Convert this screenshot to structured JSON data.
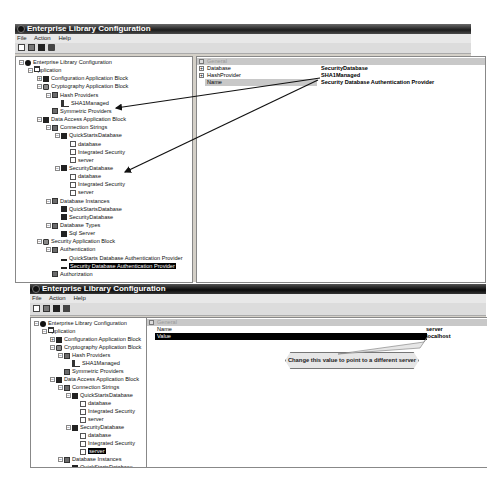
{
  "top_window": {
    "title": "Enterprise Library Configuration",
    "menu": [
      "File",
      "Action",
      "Help"
    ],
    "toolbar": [
      "new-icon",
      "open-icon",
      "save-icon",
      "save-all-icon"
    ],
    "tree": [
      {
        "label": "Enterprise Library Configuration",
        "level": 0,
        "icon": "root",
        "expander": "−"
      },
      {
        "label": "Application",
        "level": 1,
        "icon": "win",
        "expander": "−"
      },
      {
        "label": "Configuration Application Block",
        "level": 2,
        "icon": "db",
        "expander": "+"
      },
      {
        "label": "Cryptography Application Block",
        "level": 2,
        "icon": "lock",
        "expander": "−"
      },
      {
        "label": "Hash Providers",
        "level": 3,
        "icon": "folder",
        "expander": "−"
      },
      {
        "label": "SHA1Managed",
        "level": 4,
        "icon": "key",
        "expander": ""
      },
      {
        "label": "Symmetric Providers",
        "level": 3,
        "icon": "folder",
        "expander": ""
      },
      {
        "label": "Data Access Application Block",
        "level": 2,
        "icon": "db",
        "expander": "−"
      },
      {
        "label": "Connection Strings",
        "level": 3,
        "icon": "folder",
        "expander": "−"
      },
      {
        "label": "QuickStartsDatabase",
        "level": 4,
        "icon": "db",
        "expander": "−"
      },
      {
        "label": "database",
        "level": 5,
        "icon": "doc",
        "expander": ""
      },
      {
        "label": "Integrated Security",
        "level": 5,
        "icon": "doc",
        "expander": ""
      },
      {
        "label": "server",
        "level": 5,
        "icon": "doc",
        "expander": ""
      },
      {
        "label": "SecurityDatabase",
        "level": 4,
        "icon": "db",
        "expander": "−"
      },
      {
        "label": "database",
        "level": 5,
        "icon": "doc",
        "expander": ""
      },
      {
        "label": "Integrated Security",
        "level": 5,
        "icon": "doc",
        "expander": ""
      },
      {
        "label": "server",
        "level": 5,
        "icon": "doc",
        "expander": ""
      },
      {
        "label": "Database Instances",
        "level": 3,
        "icon": "folder",
        "expander": "−"
      },
      {
        "label": "QuickStartsDatabase",
        "level": 4,
        "icon": "db",
        "expander": ""
      },
      {
        "label": "SecurityDatabase",
        "level": 4,
        "icon": "db",
        "expander": ""
      },
      {
        "label": "Database Types",
        "level": 3,
        "icon": "folder",
        "expander": "−"
      },
      {
        "label": "Sql Server",
        "level": 4,
        "icon": "db",
        "expander": ""
      },
      {
        "label": "Security Application Block",
        "level": 2,
        "icon": "lock",
        "expander": "−"
      },
      {
        "label": "Authentication",
        "level": 3,
        "icon": "folder",
        "expander": "−"
      },
      {
        "label": "QuickStarts Database Authentication Provider",
        "level": 4,
        "icon": "prov",
        "expander": ""
      },
      {
        "label": "Security Database Authentication Provider",
        "level": 4,
        "icon": "prov",
        "expander": "",
        "selected": true
      },
      {
        "label": "Authorization",
        "level": 3,
        "icon": "folder",
        "expander": ""
      }
    ],
    "properties": {
      "category": "General",
      "rows": [
        {
          "name": "Database",
          "value": "SecurityDatabase",
          "expander": "+"
        },
        {
          "name": "HashProvider",
          "value": "SHA1Managed",
          "expander": "+"
        },
        {
          "name": "Name",
          "value": "Security Database Authentication Provider",
          "expander": "",
          "highlight": true
        }
      ]
    }
  },
  "bottom_window": {
    "title": "Enterprise Library Configuration",
    "menu": [
      "File",
      "Action",
      "Help"
    ],
    "toolbar": [
      "new-icon",
      "open-icon",
      "save-icon",
      "save-all-icon"
    ],
    "tree": [
      {
        "label": "Enterprise Library Configuration",
        "level": 0,
        "icon": "root",
        "expander": "−"
      },
      {
        "label": "Application",
        "level": 1,
        "icon": "win",
        "expander": "−"
      },
      {
        "label": "Configuration Application Block",
        "level": 2,
        "icon": "db",
        "expander": "+"
      },
      {
        "label": "Cryptography Application Block",
        "level": 2,
        "icon": "lock",
        "expander": "−"
      },
      {
        "label": "Hash Providers",
        "level": 3,
        "icon": "folder",
        "expander": "−"
      },
      {
        "label": "SHA1Managed",
        "level": 4,
        "icon": "key",
        "expander": ""
      },
      {
        "label": "Symmetric Providers",
        "level": 3,
        "icon": "folder",
        "expander": ""
      },
      {
        "label": "Data Access Application Block",
        "level": 2,
        "icon": "db",
        "expander": "−"
      },
      {
        "label": "Connection Strings",
        "level": 3,
        "icon": "folder",
        "expander": "−"
      },
      {
        "label": "QuickStartsDatabase",
        "level": 4,
        "icon": "db",
        "expander": "−"
      },
      {
        "label": "database",
        "level": 5,
        "icon": "doc",
        "expander": ""
      },
      {
        "label": "Integrated Security",
        "level": 5,
        "icon": "doc",
        "expander": ""
      },
      {
        "label": "server",
        "level": 5,
        "icon": "doc",
        "expander": ""
      },
      {
        "label": "SecurityDatabase",
        "level": 4,
        "icon": "db",
        "expander": "−"
      },
      {
        "label": "database",
        "level": 5,
        "icon": "doc",
        "expander": ""
      },
      {
        "label": "Integrated Security",
        "level": 5,
        "icon": "doc",
        "expander": ""
      },
      {
        "label": "server",
        "level": 5,
        "icon": "doc",
        "expander": "",
        "selected": true
      },
      {
        "label": "Database Instances",
        "level": 3,
        "icon": "folder",
        "expander": "−"
      },
      {
        "label": "QuickStartsDatabase",
        "level": 4,
        "icon": "db",
        "expander": ""
      }
    ],
    "properties": {
      "category": "General",
      "rows": [
        {
          "name": "Name",
          "value": "server",
          "highlight": false
        },
        {
          "name": "Value",
          "value": "localhost",
          "highlight": true
        }
      ]
    },
    "callout": "Change this value to point to a different server"
  },
  "colors": {
    "selection": "#000000",
    "titlebar": "#1c1c1c",
    "category_row": "#c8c8c8",
    "window_bg": "#d4d0c8"
  }
}
